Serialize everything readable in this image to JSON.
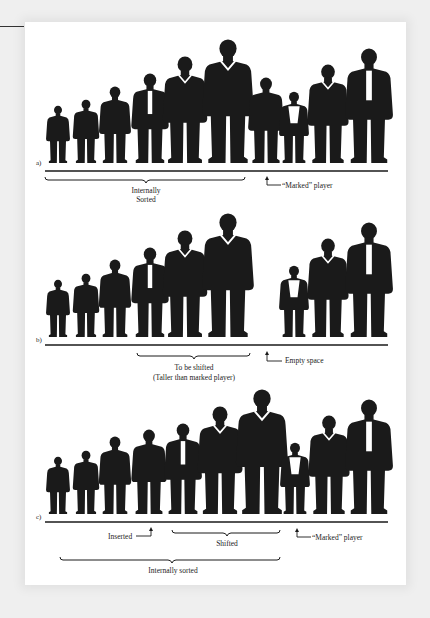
{
  "panels": [
    {
      "id": "a",
      "label": "a)",
      "players": [
        "s1",
        "s2",
        "s3",
        "s4",
        "s5",
        "s6",
        "s7",
        "s8",
        "s9",
        "s10"
      ],
      "annotations": {
        "brace1_line1": "Internally",
        "brace1_line2": "Sorted",
        "arrow_label": "“Marked” player"
      }
    },
    {
      "id": "b",
      "label": "b)",
      "annotations": {
        "brace1_line1": "To be shifted",
        "brace1_line2": "(Taller than marked player)",
        "arrow_label": "Empty space"
      }
    },
    {
      "id": "c",
      "label": "c)",
      "annotations": {
        "inserted_label": "Inserted",
        "shifted_label": "Shifted",
        "arrow_label": "“Marked” player",
        "sorted_label": "Internally sorted"
      }
    }
  ],
  "colors": {
    "ink": "#1a1a1a",
    "paper": "#ffffff",
    "background": "#efefef"
  }
}
